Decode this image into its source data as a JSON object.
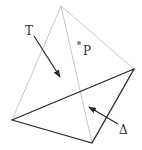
{
  "diagram": {
    "colors": {
      "light_edge": "#c8c8c8",
      "dark_edge": "#2a2a2a",
      "arrow": "#2a2a2a",
      "point": "#888888",
      "label": "#333333"
    },
    "vertices": {
      "apex": [
        61,
        6
      ],
      "left": [
        12,
        120
      ],
      "right": [
        134,
        69
      ],
      "bottom": [
        92,
        143
      ]
    },
    "labels": {
      "T": "T",
      "P": "P",
      "Delta": "Δ"
    },
    "point_P": [
      79,
      43
    ]
  }
}
